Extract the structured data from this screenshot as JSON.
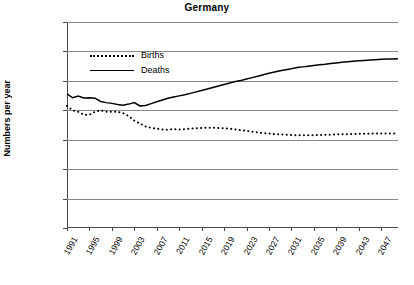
{
  "chart_data": {
    "type": "line",
    "title": "Germany",
    "xlabel": "",
    "ylabel": "Numbers per year",
    "ylim": [
      0,
      1400000
    ],
    "xlim": [
      1991,
      2050
    ],
    "grid": true,
    "legend_position": "top-left-inside",
    "ytick_labels": [
      "1,400,000",
      "1,200,000",
      "1,000,000",
      "800,000",
      "600,000",
      "400,000",
      "200,000",
      "0"
    ],
    "ytick_values": [
      1400000,
      1200000,
      1000000,
      800000,
      600000,
      400000,
      200000,
      0
    ],
    "xtick_labels": [
      "1991",
      "1995",
      "1999",
      "2003",
      "2007",
      "2011",
      "2015",
      "2019",
      "2023",
      "2027",
      "2031",
      "2035",
      "2039",
      "2043",
      "2047"
    ],
    "xtick_values": [
      1991,
      1995,
      1999,
      2003,
      2007,
      2011,
      2015,
      2019,
      2023,
      2027,
      2031,
      2035,
      2039,
      2043,
      2047
    ],
    "x": [
      1991,
      1992,
      1993,
      1994,
      1995,
      1996,
      1997,
      1998,
      1999,
      2000,
      2001,
      2002,
      2003,
      2004,
      2005,
      2006,
      2007,
      2008,
      2009,
      2010,
      2011,
      2012,
      2013,
      2014,
      2015,
      2016,
      2017,
      2018,
      2019,
      2020,
      2021,
      2022,
      2023,
      2024,
      2025,
      2026,
      2027,
      2028,
      2029,
      2030,
      2031,
      2032,
      2033,
      2034,
      2035,
      2036,
      2037,
      2038,
      2039,
      2040,
      2041,
      2042,
      2043,
      2044,
      2045,
      2046,
      2047,
      2048,
      2049,
      2050
    ],
    "series": [
      {
        "name": "Births",
        "style": "dotted",
        "color": "#000000",
        "values": [
          830000,
          800000,
          790000,
          770000,
          770000,
          790000,
          800000,
          790000,
          790000,
          790000,
          780000,
          760000,
          730000,
          710000,
          690000,
          680000,
          675000,
          670000,
          668000,
          672000,
          670000,
          672000,
          675000,
          678000,
          680000,
          682000,
          682000,
          680000,
          678000,
          675000,
          670000,
          665000,
          660000,
          655000,
          650000,
          645000,
          642000,
          638000,
          636000,
          634000,
          632000,
          630000,
          630000,
          630000,
          631000,
          632000,
          633000,
          634000,
          636000,
          637000,
          638000,
          639000,
          640000,
          641000,
          641000,
          642000,
          642000,
          642000,
          642000,
          642000
        ]
      },
      {
        "name": "Deaths",
        "style": "solid",
        "color": "#000000",
        "values": [
          911000,
          885000,
          897000,
          884000,
          885000,
          882000,
          860000,
          852000,
          847000,
          839000,
          835000,
          842000,
          853000,
          830000,
          832000,
          845000,
          858000,
          870000,
          882000,
          890000,
          898000,
          905000,
          915000,
          925000,
          935000,
          945000,
          955000,
          965000,
          975000,
          985000,
          995000,
          1003000,
          1012000,
          1022000,
          1032000,
          1042000,
          1052000,
          1060000,
          1068000,
          1075000,
          1082000,
          1090000,
          1095000,
          1100000,
          1105000,
          1110000,
          1113000,
          1118000,
          1122000,
          1126000,
          1130000,
          1133000,
          1136000,
          1139000,
          1142000,
          1144000,
          1146000,
          1148000,
          1149000,
          1150000
        ]
      }
    ]
  }
}
